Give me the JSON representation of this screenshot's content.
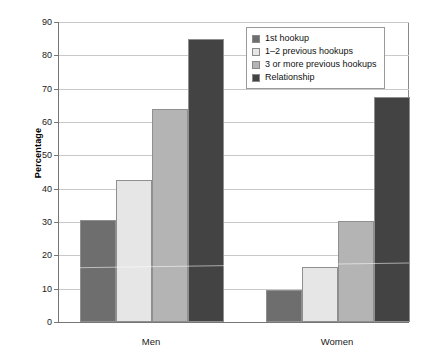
{
  "chart_data": {
    "type": "bar",
    "title": "",
    "xlabel": "",
    "ylabel": "Percentage",
    "ylim": [
      0,
      90
    ],
    "ytick_step": 10,
    "yticks": [
      90,
      80,
      70,
      60,
      50,
      40,
      30,
      20,
      10,
      0
    ],
    "ytick_labels": [
      "90",
      "80",
      "70",
      "60",
      "50",
      "40",
      "30",
      "20",
      "10",
      "0"
    ],
    "categories": [
      "Men",
      "Women"
    ],
    "grid": true,
    "legend_position": "top-right",
    "series": [
      {
        "name": "1st hookup",
        "color": "#6e6e6e",
        "values": [
          30.5,
          9.7
        ]
      },
      {
        "name": "1–2 previous hookups",
        "color": "#e6e6e6",
        "values": [
          42.6,
          16.6
        ]
      },
      {
        "name": "3 or more previous hookups",
        "color": "#b4b4b4",
        "values": [
          64.0,
          30.2
        ]
      },
      {
        "name": "Relationship",
        "color": "#434343",
        "values": [
          84.8,
          67.4
        ]
      }
    ]
  },
  "axis": {
    "y_title": "Percentage"
  },
  "legend": {
    "entries": [
      {
        "label": "1st hookup",
        "color": "#6e6e6e"
      },
      {
        "label": "1–2 previous hookups",
        "color": "#e6e6e6"
      },
      {
        "label": "3 or more previous hookups",
        "color": "#b4b4b4"
      },
      {
        "label": "Relationship",
        "color": "#434343"
      }
    ]
  }
}
